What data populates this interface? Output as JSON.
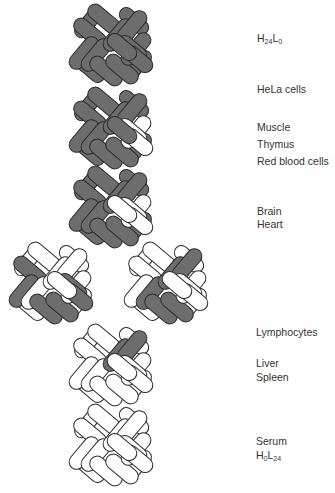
{
  "colors": {
    "H_subunit": "#6d6d6d",
    "L_subunit": "#ffffff",
    "outline": "#2b2b2b",
    "background": "#ffffff"
  },
  "legend_meaning": {
    "dark": "H subunit",
    "white": "L subunit"
  },
  "shells": [
    {
      "id": "s1",
      "cx": 112,
      "cy": 45,
      "dark": [
        1,
        1,
        1,
        1,
        1,
        1,
        1,
        1,
        1,
        1,
        1,
        1
      ]
    },
    {
      "id": "s2",
      "cx": 112,
      "cy": 128,
      "dark": [
        1,
        1,
        1,
        1,
        1,
        1,
        1,
        1,
        0,
        0,
        0,
        1
      ]
    },
    {
      "id": "s3",
      "cx": 112,
      "cy": 207,
      "dark": [
        1,
        1,
        1,
        1,
        1,
        1,
        1,
        1,
        0,
        0,
        0,
        0
      ]
    },
    {
      "id": "s4a",
      "cx": 52,
      "cy": 283,
      "dark": [
        0,
        1,
        1,
        0,
        1,
        1,
        0,
        0,
        0,
        1,
        1,
        0
      ]
    },
    {
      "id": "s4b",
      "cx": 167,
      "cy": 283,
      "dark": [
        0,
        0,
        0,
        1,
        1,
        1,
        1,
        1,
        0,
        0,
        0,
        0
      ]
    },
    {
      "id": "s5",
      "cx": 112,
      "cy": 365,
      "dark": [
        0,
        0,
        0,
        0,
        0,
        0,
        1,
        1,
        0,
        0,
        0,
        0
      ]
    },
    {
      "id": "s6",
      "cx": 112,
      "cy": 445,
      "dark": [
        0,
        0,
        0,
        0,
        0,
        0,
        0,
        0,
        0,
        0,
        0,
        0
      ]
    }
  ],
  "labels": {
    "h24l0": {
      "base1": "H",
      "sub1": "24",
      "base2": "L",
      "sub2": "0"
    },
    "hela": "HeLa cells",
    "muscle": "Muscle",
    "thymus": "Thymus",
    "rbc": "Red blood cells",
    "brain": "Brain",
    "heart": "Heart",
    "lymphocytes": "Lymphocytes",
    "liver": "Liver",
    "spleen": "Spleen",
    "serum": "Serum",
    "h0l24": {
      "base1": "H",
      "sub1": "0",
      "base2": "L",
      "sub2": "24"
    }
  }
}
